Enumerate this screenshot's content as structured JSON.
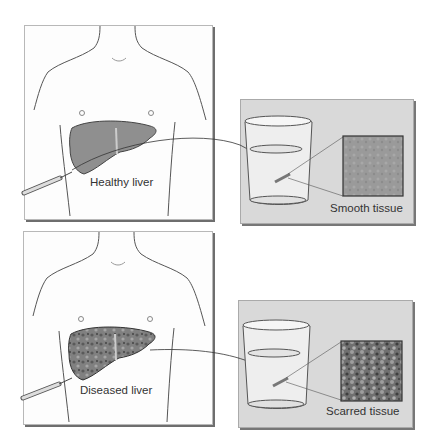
{
  "diagram": {
    "top": {
      "liver_label": "Healthy liver",
      "tissue_label": "Smooth tissue",
      "liver_state": "healthy",
      "tissue_texture": "smooth"
    },
    "bottom": {
      "liver_label": "Diseased liver",
      "tissue_label": "Scarred tissue",
      "liver_state": "diseased",
      "tissue_texture": "scarred"
    },
    "icons": [
      "torso-illustration",
      "liver-illustration",
      "biopsy-needle-icon",
      "specimen-jar-icon",
      "tissue-sample-icon",
      "arrow-icon"
    ],
    "colors": {
      "panel_bg": "#d9d9d9",
      "frame_border": "#6e6e6e",
      "liver_healthy": "#8f8f8f",
      "liver_diseased": "#6a6a6a",
      "text": "#333333"
    }
  }
}
